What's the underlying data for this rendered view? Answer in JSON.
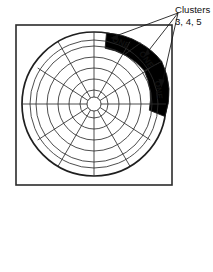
{
  "figure": {
    "annotation": {
      "title": "Clusters",
      "subtitle": "3, 4, 5"
    },
    "sectors": [
      {
        "label": "ONE",
        "cluster": "3"
      },
      {
        "label": "ONE",
        "cluster": "4"
      },
      {
        "label": "ONE",
        "cluster": "5"
      }
    ],
    "colors": {
      "sector_fill": "#a8a8a8",
      "line": "#2e2e2e",
      "frame": "#2b2b2b",
      "background": "#ffffff",
      "text": "#111111"
    },
    "geometry": {
      "frame": {
        "x": 16,
        "y": 25,
        "width": 156,
        "height": 160
      },
      "center": {
        "x": 94,
        "y": 104
      },
      "outer_radius": 72,
      "hub_radius": 7,
      "ring_count": 6,
      "spoke_count": 12,
      "spoke_step_degrees": 30,
      "ring_radii": [
        14,
        25,
        36,
        47,
        58,
        64,
        72
      ],
      "sector_band": {
        "inner_radius": 64,
        "outer_radius": 72
      },
      "sector_angles_degrees": [
        {
          "start": -80,
          "end": -50
        },
        {
          "start": -50,
          "end": -20
        },
        {
          "start": -20,
          "end": 10
        }
      ],
      "leader_origin": {
        "x": 178,
        "y": 13
      },
      "leader_targets": [
        {
          "x": 111,
          "y": 38
        },
        {
          "x": 144,
          "y": 55
        },
        {
          "x": 161,
          "y": 86
        }
      ]
    }
  }
}
